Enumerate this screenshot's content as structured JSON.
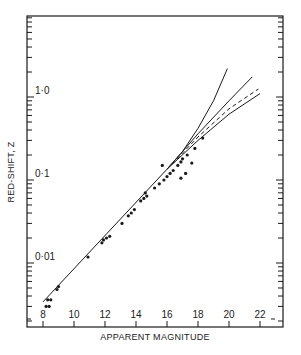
{
  "chart_data": {
    "type": "scatter",
    "title": "",
    "xlabel": "APPARENT MAGNITUDE",
    "ylabel": "RED-SHIFT, Z",
    "xlim": [
      6.3,
      23.2
    ],
    "ylim": [
      0.0018,
      9.0
    ],
    "yscale": "log",
    "grid": false,
    "legend": null,
    "x_ticks": [
      8,
      10,
      12,
      14,
      16,
      18,
      20,
      22
    ],
    "x_tick_labels": [
      "8",
      "10",
      "12",
      "14",
      "16",
      "18",
      "20",
      "22"
    ],
    "y_ticks": [
      0.01,
      0.1,
      1.0
    ],
    "y_tick_labels": [
      "0·01",
      "0·1",
      "1·0"
    ],
    "series": [
      {
        "name": "observed galaxies",
        "kind": "scatter",
        "points": [
          [
            8.2,
            0.003
          ],
          [
            8.4,
            0.003
          ],
          [
            8.3,
            0.0036
          ],
          [
            8.5,
            0.0036
          ],
          [
            8.9,
            0.0048
          ],
          [
            9.0,
            0.0052
          ],
          [
            10.9,
            0.0118
          ],
          [
            11.8,
            0.0175
          ],
          [
            11.9,
            0.019
          ],
          [
            12.1,
            0.02
          ],
          [
            12.3,
            0.021
          ],
          [
            13.1,
            0.03
          ],
          [
            13.5,
            0.037
          ],
          [
            13.7,
            0.04
          ],
          [
            13.9,
            0.044
          ],
          [
            14.3,
            0.056
          ],
          [
            14.5,
            0.06
          ],
          [
            14.7,
            0.064
          ],
          [
            14.6,
            0.07
          ],
          [
            15.2,
            0.08
          ],
          [
            15.5,
            0.09
          ],
          [
            15.8,
            0.1
          ],
          [
            15.7,
            0.15
          ],
          [
            16.0,
            0.11
          ],
          [
            16.2,
            0.12
          ],
          [
            16.4,
            0.13
          ],
          [
            16.7,
            0.15
          ],
          [
            16.9,
            0.165
          ],
          [
            17.0,
            0.18
          ],
          [
            17.3,
            0.2
          ],
          [
            17.2,
            0.12
          ],
          [
            16.9,
            0.105
          ],
          [
            17.6,
            0.16
          ],
          [
            17.8,
            0.24
          ],
          [
            18.3,
            0.32
          ]
        ]
      },
      {
        "name": "linear fit",
        "kind": "line",
        "style": "solid",
        "points": [
          [
            8.0,
            0.0034
          ],
          [
            16.0,
            0.135
          ]
        ]
      },
      {
        "name": "curve A (steepest)",
        "kind": "line",
        "style": "solid",
        "points": [
          [
            16.0,
            0.135
          ],
          [
            17.0,
            0.22
          ],
          [
            18.0,
            0.42
          ],
          [
            19.0,
            0.9
          ],
          [
            19.9,
            2.2
          ]
        ]
      },
      {
        "name": "curve B",
        "kind": "line",
        "style": "solid",
        "points": [
          [
            16.0,
            0.135
          ],
          [
            18.0,
            0.36
          ],
          [
            20.0,
            0.9
          ],
          [
            21.5,
            1.75
          ]
        ]
      },
      {
        "name": "curve C",
        "kind": "line",
        "style": "dashed",
        "points": [
          [
            16.0,
            0.135
          ],
          [
            18.0,
            0.33
          ],
          [
            20.0,
            0.72
          ],
          [
            21.9,
            1.25
          ]
        ]
      },
      {
        "name": "curve D",
        "kind": "line",
        "style": "solid",
        "points": [
          [
            16.0,
            0.135
          ],
          [
            18.0,
            0.3
          ],
          [
            20.0,
            0.62
          ],
          [
            22.0,
            1.1
          ]
        ]
      }
    ]
  },
  "colors": {
    "ink": "#1a1a1a",
    "background": "#ffffff"
  }
}
